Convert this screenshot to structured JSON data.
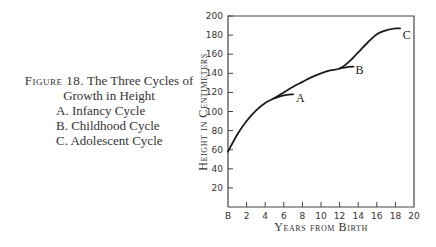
{
  "caption": {
    "figure_label": "Figure 18.",
    "title_part1": "The Three Cycles of",
    "title_part2": "Growth in Height",
    "items": [
      {
        "letter": "A.",
        "label": "Infancy Cycle"
      },
      {
        "letter": "B.",
        "label": "Childhood Cycle"
      },
      {
        "letter": "C.",
        "label": "Adolescent Cycle"
      }
    ]
  },
  "chart_data": {
    "type": "line",
    "title": "The Three Cycles of Growth in Height",
    "xlabel": "Years from Birth",
    "ylabel": "Height in Centimeters",
    "xlim": [
      0,
      20
    ],
    "ylim": [
      0,
      200
    ],
    "x_ticks": [
      "B",
      "2",
      "4",
      "6",
      "8",
      "10",
      "12",
      "14",
      "16",
      "18",
      "20"
    ],
    "y_ticks": [
      "20",
      "40",
      "60",
      "80",
      "100",
      "120",
      "140",
      "160",
      "180",
      "200"
    ],
    "grid": false,
    "series": [
      {
        "name": "Growth curve",
        "x": [
          0,
          1,
          2,
          3,
          4,
          5,
          6,
          7,
          8,
          9,
          10,
          11,
          12,
          13,
          14,
          15,
          16,
          17,
          18,
          18.5
        ],
        "y": [
          58,
          76,
          90,
          101,
          109,
          114,
          120,
          126,
          131,
          136,
          140,
          143,
          145,
          152,
          162,
          172,
          181,
          185,
          187,
          187
        ]
      },
      {
        "name": "A - Infancy Cycle (projected)",
        "x": [
          5,
          6,
          7
        ],
        "y": [
          114,
          117,
          118
        ]
      },
      {
        "name": "B - Childhood Cycle (projected)",
        "x": [
          12,
          12.8,
          13.5
        ],
        "y": [
          145,
          146.5,
          147
        ]
      }
    ],
    "annotations": [
      {
        "text": "A",
        "x": 7.3,
        "y": 114
      },
      {
        "text": "B",
        "x": 13.7,
        "y": 143
      },
      {
        "text": "C",
        "x": 18.8,
        "y": 180
      }
    ]
  }
}
